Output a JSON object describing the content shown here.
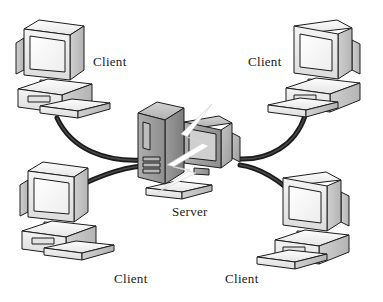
{
  "diagram": {
    "background_color": "#ffffff",
    "nodes": [
      {
        "id": "client-top-left",
        "label": "Client",
        "type": "workstation",
        "position": "top-left",
        "label_x": 93,
        "label_y": 66
      },
      {
        "id": "client-top-right",
        "label": "Client",
        "type": "workstation",
        "position": "top-right",
        "label_x": 248,
        "label_y": 66
      },
      {
        "id": "server-center",
        "label": "Server",
        "type": "tower-server",
        "position": "center",
        "label_x": 172,
        "label_y": 216
      },
      {
        "id": "client-bottom-left",
        "label": "Client",
        "type": "workstation",
        "position": "bottom-left",
        "label_x": 114,
        "label_y": 283
      },
      {
        "id": "client-bottom-right",
        "label": "Client",
        "type": "workstation",
        "position": "bottom-right",
        "label_x": 225,
        "label_y": 283
      }
    ],
    "links": [
      {
        "id": "link-top-left",
        "from": "client-top-left",
        "to": "server-center"
      },
      {
        "id": "link-top-right",
        "from": "client-top-right",
        "to": "server-center"
      },
      {
        "id": "link-bottom-left",
        "from": "client-bottom-left",
        "to": "server-center"
      },
      {
        "id": "link-bottom-right",
        "from": "client-bottom-right",
        "to": "server-center"
      }
    ],
    "annotations": [
      {
        "id": "failure-bolt",
        "kind": "lightning-bolt",
        "meaning": "server failure",
        "color": "#ffffff"
      }
    ],
    "palette": {
      "outline": "#1c1c1c",
      "cable": "#1a1a1a",
      "case_light": "#f2f2f2",
      "case_mid": "#d8d8d8",
      "case_shade": "#bdbdbd",
      "screen": "#fbfbfb",
      "server_body": "#9a9a9a",
      "server_shade": "#7e7e7e",
      "label_text": "#1b1b1b"
    }
  }
}
